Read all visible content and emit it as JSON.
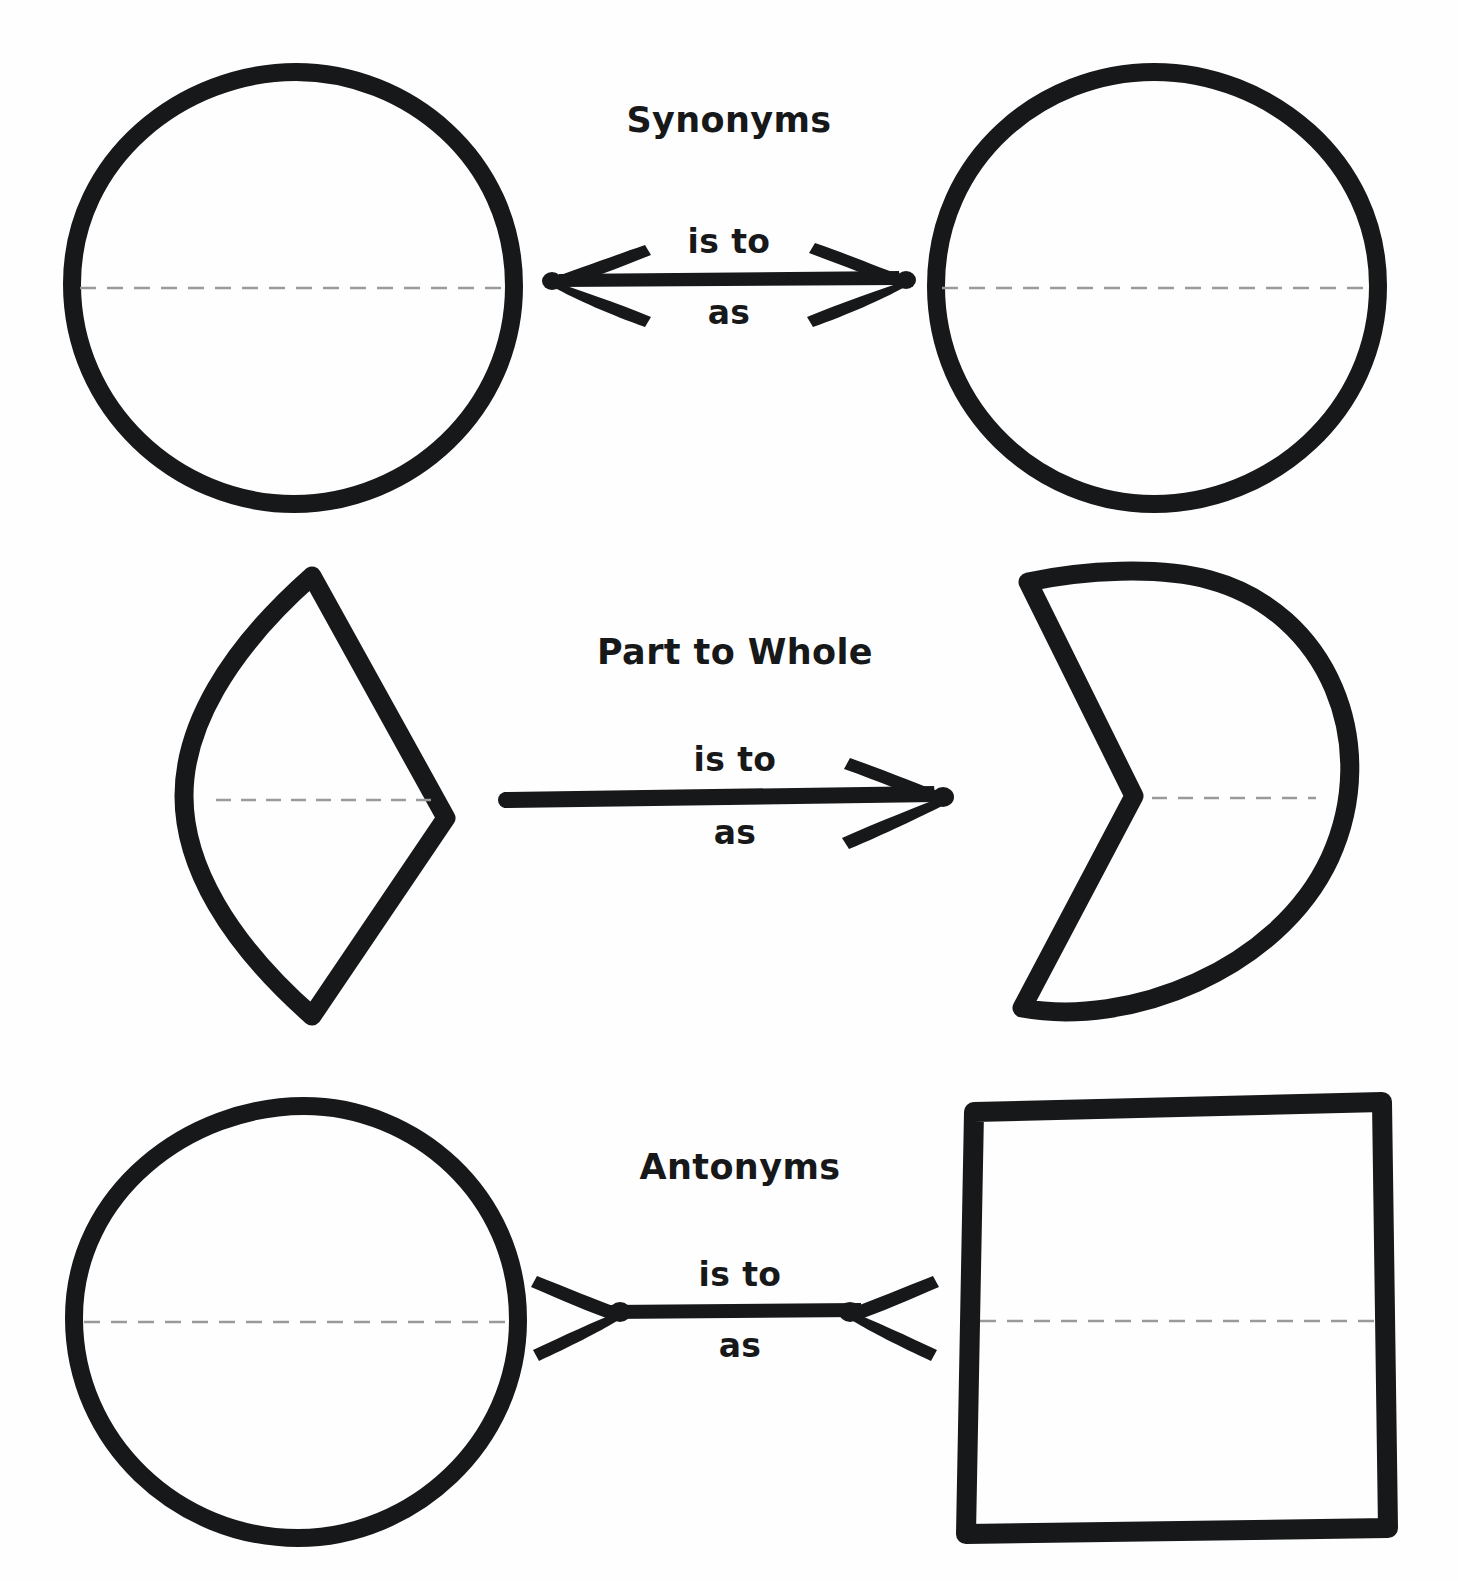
{
  "page": {
    "background_color": "#fefefe",
    "ink_color": "#17181a",
    "dash_color": "#9a9a9a",
    "title_note": "analogy worksheet with geometric shapes"
  },
  "rows": [
    {
      "id": "synonyms",
      "relation_label": "Synonyms",
      "is_to_label": "is to",
      "as_label": "as",
      "arrow": {
        "type": "double-outward",
        "name": "double-headed-arrow"
      },
      "left_shape": {
        "name": "circle",
        "kind": "circle",
        "has_center_dashed_line": true
      },
      "right_shape": {
        "name": "circle",
        "kind": "circle",
        "has_center_dashed_line": true
      }
    },
    {
      "id": "part-to-whole",
      "relation_label": "Part to Whole",
      "is_to_label": "is to",
      "as_label": "as",
      "arrow": {
        "type": "single-right",
        "name": "right-arrow"
      },
      "left_shape": {
        "name": "circular-segment",
        "kind": "segment",
        "has_center_dashed_line": true
      },
      "right_shape": {
        "name": "circle-with-wedge-removed",
        "kind": "pacman",
        "has_center_dashed_line": true
      }
    },
    {
      "id": "antonyms",
      "relation_label": "Antonyms",
      "is_to_label": "is to",
      "as_label": "as",
      "arrow": {
        "type": "double-inward",
        "name": "inward-double-arrow"
      },
      "left_shape": {
        "name": "circle",
        "kind": "circle",
        "has_center_dashed_line": true
      },
      "right_shape": {
        "name": "square",
        "kind": "square",
        "has_center_dashed_line": true
      }
    }
  ]
}
